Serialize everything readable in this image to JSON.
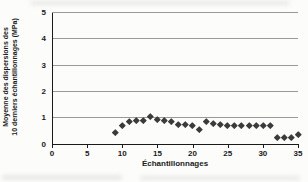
{
  "colors": {
    "background": "#fcfcfb",
    "axis": "#1a1a1a",
    "grid": "#9a9a9a",
    "marker": "#3b3b3b",
    "text": "#1a1a1a",
    "smudge": "#cfcfca"
  },
  "chart_data": {
    "type": "scatter",
    "title": "",
    "xlabel": "Échantillonnages",
    "ylabel_line1": "Moyenne des dispersions des",
    "ylabel_line2": "10 derniers échantillonnages (MPa)",
    "xlim": [
      0,
      35
    ],
    "ylim": [
      0,
      5
    ],
    "x_ticks": [
      0,
      5,
      10,
      15,
      20,
      25,
      30,
      35
    ],
    "y_ticks": [
      0,
      1,
      2,
      3,
      4,
      5
    ],
    "grid": "horizontal-only",
    "legend": "none",
    "marker": "diamond",
    "x": [
      9,
      10,
      11,
      12,
      13,
      14,
      15,
      16,
      17,
      18,
      19,
      20,
      21,
      22,
      23,
      24,
      25,
      26,
      27,
      28,
      29,
      30,
      31,
      32,
      33,
      34,
      35
    ],
    "y": [
      0.45,
      0.7,
      0.85,
      0.9,
      0.9,
      1.05,
      0.95,
      0.9,
      0.85,
      0.75,
      0.75,
      0.7,
      0.55,
      0.85,
      0.8,
      0.75,
      0.7,
      0.7,
      0.7,
      0.7,
      0.7,
      0.7,
      0.7,
      0.25,
      0.25,
      0.25,
      0.35
    ]
  }
}
